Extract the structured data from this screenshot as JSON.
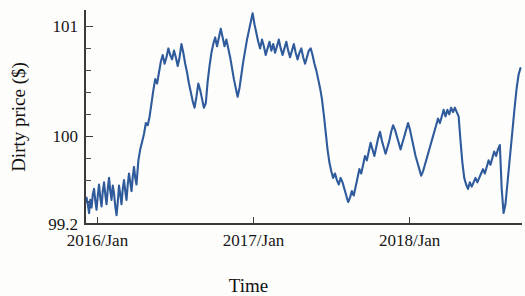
{
  "chart_data": {
    "type": "line",
    "title": "",
    "subtitle": "",
    "xlabel": "Time",
    "ylabel": "Dirty price ($)",
    "grid": false,
    "legend": null,
    "legend_position": "none",
    "series_color": "#2f5b9c",
    "axis_color": "#3a3a3a",
    "xlim": [
      2015.92,
      2018.72
    ],
    "ylim": [
      99.2,
      101.15
    ],
    "x_tick_labels": [
      "2016/Jan",
      "2017/Jan",
      "2018/Jan"
    ],
    "x_tick_values": [
      2016.0,
      2017.0,
      2018.0
    ],
    "y_tick_labels": [
      "99.2",
      "100",
      "101"
    ],
    "y_tick_values": [
      99.2,
      100,
      101
    ],
    "y_minor_tick_values": [
      99.4,
      99.6,
      99.8,
      100.2,
      100.4,
      100.6,
      100.8,
      101.0
    ],
    "series": [
      {
        "name": "Dirty price",
        "x": [
          2015.93,
          2015.938,
          2015.946,
          2015.954,
          2015.962,
          2015.97,
          2015.978,
          2015.986,
          2015.994,
          2016.002,
          2016.01,
          2016.018,
          2016.026,
          2016.034,
          2016.042,
          2016.05,
          2016.058,
          2016.066,
          2016.074,
          2016.082,
          2016.09,
          2016.098,
          2016.106,
          2016.114,
          2016.122,
          2016.13,
          2016.138,
          2016.146,
          2016.154,
          2016.162,
          2016.17,
          2016.178,
          2016.186,
          2016.194,
          2016.202,
          2016.21,
          2016.218,
          2016.226,
          2016.234,
          2016.242,
          2016.25,
          2016.262,
          2016.274,
          2016.286,
          2016.298,
          2016.31,
          2016.322,
          2016.334,
          2016.346,
          2016.358,
          2016.37,
          2016.382,
          2016.394,
          2016.406,
          2016.418,
          2016.43,
          2016.442,
          2016.454,
          2016.466,
          2016.478,
          2016.49,
          2016.502,
          2016.514,
          2016.526,
          2016.538,
          2016.55,
          2016.562,
          2016.574,
          2016.586,
          2016.598,
          2016.61,
          2016.622,
          2016.634,
          2016.646,
          2016.658,
          2016.67,
          2016.682,
          2016.694,
          2016.706,
          2016.718,
          2016.73,
          2016.742,
          2016.754,
          2016.766,
          2016.778,
          2016.79,
          2016.802,
          2016.814,
          2016.826,
          2016.838,
          2016.85,
          2016.862,
          2016.874,
          2016.886,
          2016.898,
          2016.91,
          2016.922,
          2016.934,
          2016.946,
          2016.958,
          2016.97,
          2016.982,
          2016.994,
          2017.006,
          2017.018,
          2017.03,
          2017.042,
          2017.054,
          2017.066,
          2017.078,
          2017.09,
          2017.102,
          2017.114,
          2017.126,
          2017.138,
          2017.15,
          2017.162,
          2017.174,
          2017.186,
          2017.198,
          2017.21,
          2017.222,
          2017.234,
          2017.246,
          2017.258,
          2017.27,
          2017.282,
          2017.294,
          2017.306,
          2017.318,
          2017.33,
          2017.342,
          2017.354,
          2017.366,
          2017.378,
          2017.39,
          2017.402,
          2017.414,
          2017.426,
          2017.438,
          2017.45,
          2017.462,
          2017.474,
          2017.486,
          2017.498,
          2017.51,
          2017.522,
          2017.534,
          2017.546,
          2017.558,
          2017.57,
          2017.582,
          2017.594,
          2017.606,
          2017.618,
          2017.63,
          2017.642,
          2017.654,
          2017.666,
          2017.678,
          2017.69,
          2017.702,
          2017.714,
          2017.726,
          2017.738,
          2017.75,
          2017.762,
          2017.774,
          2017.786,
          2017.798,
          2017.81,
          2017.822,
          2017.834,
          2017.846,
          2017.858,
          2017.87,
          2017.882,
          2017.894,
          2017.906,
          2017.918,
          2017.93,
          2017.942,
          2017.954,
          2017.966,
          2017.978,
          2017.99,
          2018.002,
          2018.014,
          2018.026,
          2018.038,
          2018.05,
          2018.062,
          2018.074,
          2018.086,
          2018.098,
          2018.11,
          2018.122,
          2018.134,
          2018.146,
          2018.158,
          2018.17,
          2018.182,
          2018.194,
          2018.206,
          2018.218,
          2018.23,
          2018.242,
          2018.254,
          2018.266,
          2018.278,
          2018.29,
          2018.302,
          2018.314,
          2018.326,
          2018.338,
          2018.35,
          2018.362,
          2018.374,
          2018.386,
          2018.398,
          2018.41,
          2018.422,
          2018.434,
          2018.446,
          2018.458,
          2018.47,
          2018.482,
          2018.494,
          2018.506,
          2018.518,
          2018.53,
          2018.542,
          2018.554,
          2018.566,
          2018.578,
          2018.59,
          2018.602,
          2018.614,
          2018.626,
          2018.638,
          2018.65,
          2018.662,
          2018.674,
          2018.686,
          2018.698,
          2018.71
        ],
        "y": [
          99.44,
          99.38,
          99.3,
          99.42,
          99.35,
          99.47,
          99.52,
          99.41,
          99.33,
          99.46,
          99.56,
          99.44,
          99.36,
          99.5,
          99.58,
          99.47,
          99.38,
          99.52,
          99.62,
          99.5,
          99.42,
          99.55,
          99.48,
          99.36,
          99.28,
          99.4,
          99.55,
          99.47,
          99.38,
          99.52,
          99.6,
          99.5,
          99.42,
          99.56,
          99.66,
          99.58,
          99.5,
          99.63,
          99.72,
          99.62,
          99.56,
          99.78,
          99.88,
          99.95,
          100.02,
          100.12,
          100.1,
          100.18,
          100.3,
          100.42,
          100.52,
          100.48,
          100.58,
          100.68,
          100.74,
          100.66,
          100.72,
          100.8,
          100.74,
          100.7,
          100.78,
          100.72,
          100.64,
          100.72,
          100.84,
          100.76,
          100.66,
          100.58,
          100.48,
          100.4,
          100.32,
          100.26,
          100.36,
          100.48,
          100.42,
          100.34,
          100.26,
          100.3,
          100.5,
          100.64,
          100.76,
          100.84,
          100.9,
          100.82,
          100.9,
          100.98,
          100.9,
          100.82,
          100.88,
          100.8,
          100.72,
          100.62,
          100.52,
          100.44,
          100.36,
          100.44,
          100.56,
          100.68,
          100.78,
          100.88,
          100.96,
          101.04,
          101.12,
          101.02,
          100.94,
          100.86,
          100.8,
          100.88,
          100.82,
          100.74,
          100.8,
          100.86,
          100.78,
          100.84,
          100.76,
          100.82,
          100.88,
          100.8,
          100.74,
          100.8,
          100.86,
          100.78,
          100.72,
          100.78,
          100.84,
          100.76,
          100.7,
          100.76,
          100.8,
          100.72,
          100.66,
          100.72,
          100.78,
          100.8,
          100.74,
          100.66,
          100.6,
          100.52,
          100.44,
          100.34,
          100.2,
          100.04,
          99.88,
          99.76,
          99.68,
          99.62,
          99.66,
          99.6,
          99.56,
          99.62,
          99.58,
          99.52,
          99.46,
          99.4,
          99.44,
          99.5,
          99.46,
          99.54,
          99.62,
          99.7,
          99.66,
          99.74,
          99.82,
          99.78,
          99.86,
          99.94,
          99.88,
          99.82,
          99.9,
          99.98,
          100.04,
          99.96,
          99.9,
          99.84,
          99.9,
          99.96,
          100.04,
          100.1,
          100.06,
          100.0,
          99.94,
          99.88,
          99.94,
          100.0,
          100.06,
          100.12,
          100.06,
          99.98,
          99.9,
          99.82,
          99.76,
          99.7,
          99.64,
          99.68,
          99.74,
          99.8,
          99.86,
          99.92,
          99.98,
          100.04,
          100.1,
          100.16,
          100.12,
          100.18,
          100.24,
          100.18,
          100.24,
          100.2,
          100.26,
          100.22,
          100.26,
          100.22,
          100.18,
          99.96,
          99.76,
          99.62,
          99.56,
          99.52,
          99.58,
          99.54,
          99.58,
          99.62,
          99.58,
          99.62,
          99.66,
          99.7,
          99.66,
          99.72,
          99.78,
          99.74,
          99.8,
          99.86,
          99.82,
          99.88,
          99.92,
          99.52,
          99.3,
          99.38,
          99.56,
          99.74,
          99.92,
          100.1,
          100.28,
          100.44,
          100.56,
          100.62
        ]
      }
    ]
  }
}
